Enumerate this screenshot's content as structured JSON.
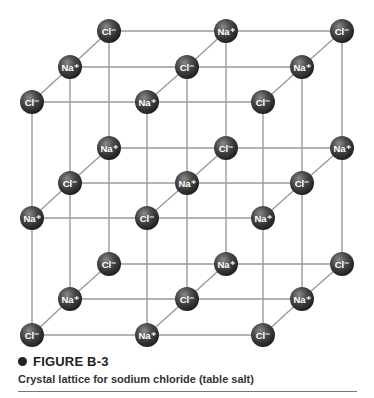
{
  "figure": {
    "number_label": "FIGURE B-3",
    "caption": "Crystal lattice for sodium chloride (table salt)"
  },
  "colors": {
    "atom": "#3a3a3a",
    "atom_highlight": "#8a8a8a",
    "bond": "#9a9a9a",
    "text": "#222222"
  },
  "lattice": {
    "description": "3x3x3 cubic lattice of alternating Na+ and Cl- ions",
    "ions": {
      "sodium": "Na⁺",
      "chloride": "Cl⁻"
    },
    "layers": [
      {
        "name": "top",
        "rows": [
          {
            "depth": "back",
            "y": 31,
            "atoms": [
              {
                "x": 109,
                "ion": "Cl⁻"
              },
              {
                "x": 226,
                "ion": "Na⁺"
              },
              {
                "x": 342,
                "ion": "Cl⁻"
              }
            ]
          },
          {
            "depth": "middle",
            "y": 67,
            "atoms": [
              {
                "x": 70,
                "ion": "Na⁺"
              },
              {
                "x": 187,
                "ion": "Cl⁻"
              },
              {
                "x": 302,
                "ion": "Na⁺"
              }
            ]
          },
          {
            "depth": "front",
            "y": 102,
            "atoms": [
              {
                "x": 32,
                "ion": "Cl⁻"
              },
              {
                "x": 147,
                "ion": "Na⁺"
              },
              {
                "x": 263,
                "ion": "Cl⁻"
              }
            ]
          }
        ]
      },
      {
        "name": "middle",
        "rows": [
          {
            "depth": "back",
            "y": 148,
            "atoms": [
              {
                "x": 109,
                "ion": "Na⁺"
              },
              {
                "x": 226,
                "ion": "Cl⁻"
              },
              {
                "x": 342,
                "ion": "Na⁺"
              }
            ]
          },
          {
            "depth": "middle",
            "y": 183,
            "atoms": [
              {
                "x": 70,
                "ion": "Cl⁻"
              },
              {
                "x": 187,
                "ion": "Na⁺"
              },
              {
                "x": 302,
                "ion": "Cl⁻"
              }
            ]
          },
          {
            "depth": "front",
            "y": 218,
            "atoms": [
              {
                "x": 32,
                "ion": "Na⁺"
              },
              {
                "x": 147,
                "ion": "Cl⁻"
              },
              {
                "x": 263,
                "ion": "Na⁺"
              }
            ]
          }
        ]
      },
      {
        "name": "bottom",
        "rows": [
          {
            "depth": "back",
            "y": 264,
            "atoms": [
              {
                "x": 109,
                "ion": "Cl⁻"
              },
              {
                "x": 226,
                "ion": "Na⁺"
              },
              {
                "x": 342,
                "ion": "Cl⁻"
              }
            ]
          },
          {
            "depth": "middle",
            "y": 299,
            "atoms": [
              {
                "x": 70,
                "ion": "Na⁺"
              },
              {
                "x": 187,
                "ion": "Cl⁻"
              },
              {
                "x": 302,
                "ion": "Na⁺"
              }
            ]
          },
          {
            "depth": "front",
            "y": 335,
            "atoms": [
              {
                "x": 32,
                "ion": "Cl⁻"
              },
              {
                "x": 147,
                "ion": "Na⁺"
              },
              {
                "x": 263,
                "ion": "Cl⁻"
              }
            ]
          }
        ]
      }
    ]
  }
}
